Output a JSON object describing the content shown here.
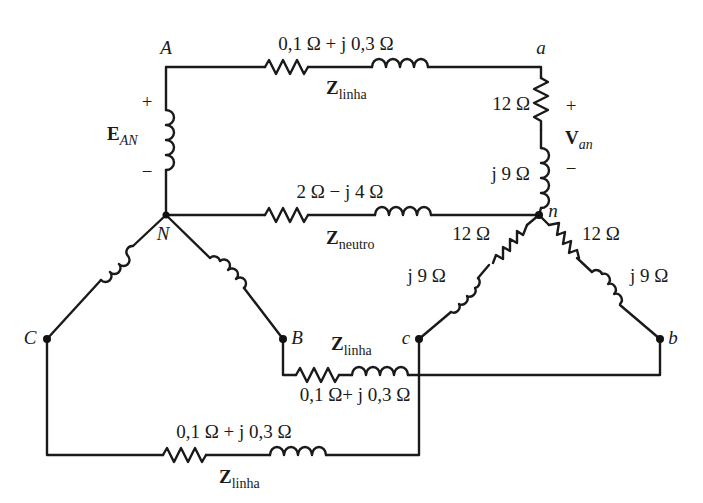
{
  "diagram": {
    "type": "three-phase Y-Y circuit",
    "nodes": {
      "A": "A",
      "N": "N",
      "B": "B",
      "C": "C",
      "a": "a",
      "n": "n",
      "b": "b",
      "c": "c"
    },
    "source": {
      "label_main": "E",
      "label_sub": "AN",
      "plus": "+",
      "minus": "−"
    },
    "load_voltage": {
      "label_main": "V",
      "label_sub": "an",
      "plus": "+",
      "minus": "−"
    },
    "line_top": {
      "impedance": "0,1 Ω + j 0,3 Ω",
      "z_main": "Z",
      "z_sub": "linha"
    },
    "neutral": {
      "impedance": "2 Ω − j 4 Ω",
      "z_main": "Z",
      "z_sub": "neutro"
    },
    "line_middle": {
      "impedance": "0,1 Ω+ j 0,3 Ω",
      "z_main": "Z",
      "z_sub": "linha"
    },
    "line_bottom": {
      "impedance": "0,1 Ω + j 0,3 Ω",
      "z_main": "Z",
      "z_sub": "linha"
    },
    "load_phase_a": {
      "resistance": "12 Ω",
      "reactance": "j 9 Ω"
    },
    "load_phase_c": {
      "resistance": "12 Ω",
      "reactance": "j 9 Ω"
    },
    "load_phase_b": {
      "resistance": "12 Ω",
      "reactance": "j 9 Ω"
    },
    "colors": {
      "ink": "#1a1a1a",
      "background": "#ffffff"
    }
  }
}
